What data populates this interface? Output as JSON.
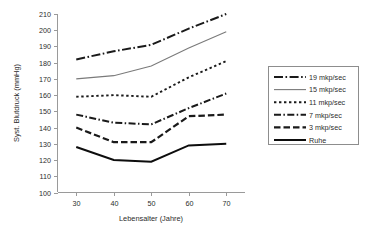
{
  "chart_data": {
    "type": "line",
    "title": "",
    "xlabel": "Lebensalter (Jahre)",
    "ylabel": "Syst. Blutdruck (mmHg)",
    "x": [
      30,
      40,
      50,
      60,
      70
    ],
    "xticks": [
      "30",
      "40",
      "50",
      "60",
      "70"
    ],
    "xlim": [
      25,
      75
    ],
    "ylim": [
      100,
      210
    ],
    "yticks": [
      "100",
      "110",
      "120",
      "130",
      "140",
      "150",
      "160",
      "170",
      "180",
      "190",
      "200",
      "210"
    ],
    "grid": false,
    "legend_position": "right",
    "series": [
      {
        "name": "19 mkp/sec",
        "values": [
          182,
          187,
          191,
          201,
          210
        ],
        "color": "#1a1a1a",
        "width": 2.0,
        "dash": "9,2.5,1.6,2.5"
      },
      {
        "name": "15 mkp/sec",
        "values": [
          170,
          172,
          178,
          189,
          199
        ],
        "color": "#7a7a7a",
        "width": 1.1,
        "dash": "none"
      },
      {
        "name": "11 mkp/sec",
        "values": [
          159,
          160,
          159,
          171,
          181
        ],
        "color": "#1a1a1a",
        "width": 1.9,
        "dash": "2.4,2.6"
      },
      {
        "name": "7 mkp/sec",
        "values": [
          148,
          143,
          142,
          152,
          161
        ],
        "color": "#1a1a1a",
        "width": 2.0,
        "dash": "7,2.4,1.5,2.4"
      },
      {
        "name": "3 mkp/sec",
        "values": [
          140,
          131,
          131,
          147,
          148
        ],
        "color": "#1a1a1a",
        "width": 2.2,
        "dash": "6.5,3"
      },
      {
        "name": "Ruhe",
        "values": [
          128,
          120,
          119,
          129,
          130
        ],
        "color": "#0d0d0d",
        "width": 2.0,
        "dash": "none"
      }
    ]
  },
  "legend": {
    "entries": [
      {
        "label": "19 mkp/sec"
      },
      {
        "label": "15 mkp/sec"
      },
      {
        "label": "11 mkp/sec"
      },
      {
        "label": "7 mkp/sec"
      },
      {
        "label": "3 mkp/sec"
      },
      {
        "label": "Ruhe"
      }
    ]
  }
}
